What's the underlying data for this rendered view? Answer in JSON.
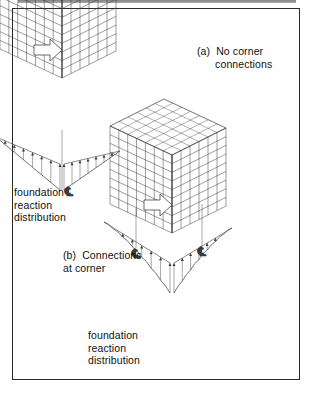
{
  "figure": {
    "background_color": "#ffffff",
    "border_color": "#2a2a2a",
    "line_color": "#3a3a3a",
    "text_color": "#111111",
    "width": 314,
    "height": 396
  },
  "labels": {
    "caption_a": "(a)  No corner\n      connections",
    "caption_b": "(b)  Connections\nat corner",
    "foundation_label_a": "foundation\nreaction\ndistribution",
    "foundation_label_b": "foundation\nreaction\ndistribution",
    "centerline_symbol": "℄"
  },
  "chart_data": {
    "type": "diagram",
    "panels": [
      {
        "id": "a",
        "caption": "(a) No corner connections",
        "building": {
          "type": "isometric-framed-box",
          "bays_front": 7,
          "bays_side": 6,
          "stories": 9,
          "origin": {
            "x": 62,
            "y": 78
          },
          "front_vec": {
            "dx": 62,
            "dy": 29
          },
          "side_vec": {
            "dx": 54,
            "dy": -27
          },
          "height": 78
        },
        "load_arrow": {
          "type": "hollow-block-arrow",
          "direction": "down-right",
          "tip": {
            "x": 62,
            "y": 72
          }
        },
        "reaction_distribution": {
          "shape": "linear",
          "description": "straight-line (linear/triangular) soil pressure along each footing edge, hatched with tick marks",
          "peak_location": "mid-edge",
          "centerlines": 1
        }
      },
      {
        "id": "b",
        "caption": "(b) Connections at corner",
        "building": {
          "type": "isometric-framed-box",
          "bays_front": 7,
          "bays_side": 6,
          "stories": 9,
          "origin": {
            "x": 172,
            "y": 233
          },
          "front_vec": {
            "dx": 62,
            "dy": 29
          },
          "side_vec": {
            "dx": 54,
            "dy": -27
          },
          "height": 78
        },
        "load_arrow": {
          "type": "hollow-block-arrow",
          "direction": "down-right",
          "tip": {
            "x": 172,
            "y": 227
          }
        },
        "reaction_distribution": {
          "shape": "curved",
          "description": "concave curved soil pressure peaking sharply at the corner, hatched with tick marks",
          "peak_location": "corner",
          "centerlines": 2
        }
      }
    ]
  }
}
